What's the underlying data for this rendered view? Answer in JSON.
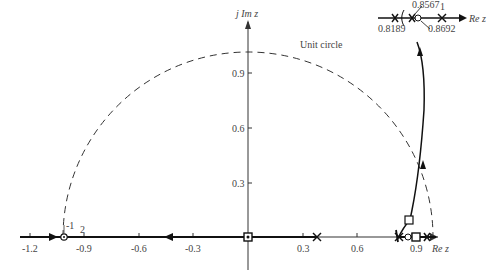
{
  "diagram": {
    "axes": {
      "x_label": "Re z",
      "y_label": "j Im z",
      "x_ticks": [
        "-1.2",
        "-0.9",
        "-0.6",
        "-0.3",
        "0.3",
        "0.6",
        "0.9"
      ],
      "y_ticks": [
        "0.3",
        "0.6",
        "0.9"
      ]
    },
    "annotations": {
      "unit_circle": "Unit circle",
      "double_point": "-1",
      "double_sub": "2"
    },
    "inset": {
      "labels": [
        "0.8567",
        "0.8189",
        "0.8692",
        "1"
      ],
      "axis_label": "Re z"
    },
    "markers": {
      "poles": [
        "0.3679",
        "0.8189",
        "1"
      ],
      "zeros": [
        "-1",
        "0.8692"
      ],
      "compensator": [
        "0",
        "0.9"
      ]
    }
  }
}
